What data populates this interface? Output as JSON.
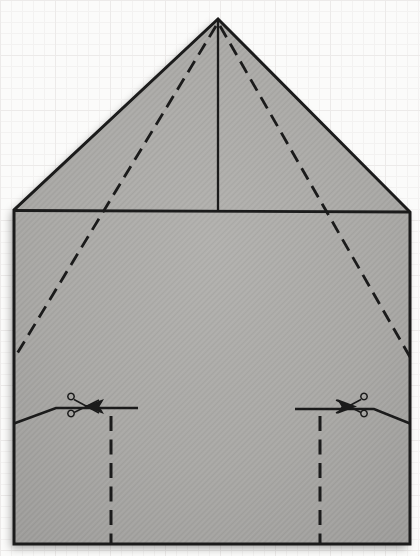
{
  "colors": {
    "background": "#fbfbfa",
    "grid_line": "#f3f2f1",
    "grid_heavy": "#eceae9",
    "paper_center": "#b2b1ae",
    "paper_mid": "#a9a8a5",
    "paper_edge": "#9c9b99",
    "ink": "#1b1b1b",
    "shadow": "rgba(0,0,0,0.35)"
  },
  "canvas": {
    "viewbox": "0 0 420 556",
    "width": "420",
    "height": "556"
  },
  "paper": {
    "outline": "M218,19 L410,212 L410,544 L14,544 L14,210 Z",
    "square_top_edge": "M14,210.5 L410,212",
    "center_crease": "M218,21 L218,211",
    "fold_line_left": "M216,26 L15,357",
    "fold_line_right": "M220,26 L410,357",
    "cut_line_left": "M14,423.5 L56,408 L138,408",
    "cut_line_right": "M295,409 L374,409 L410,423.5",
    "slit_line_left": "M111,416 L111,543",
    "slit_line_right": "M320,416 L320,544",
    "cut_arrow_left": "M84,406.5 L104,399 L99.5,406.5 L104,414 Z",
    "cut_arrow_right": "M357,406.5 L337,399 L341.5,406.5 L337,414 Z",
    "scissors_left": "M74,399.5 L99,413 M74,412.5 L99,400 M71,393.3 a3.2,3.2 0 1 0 0.01,0 M71,410.3 a3.2,3.2 0 1 0 0.01,0",
    "scissors_right": "M361,399.5 L336,413 M361,412.5 L336,400 M364,393.3 a3.2,3.2 0 1 0 0.01,0 M364,410.3 a3.2,3.2 0 1 0 0.01,0"
  }
}
